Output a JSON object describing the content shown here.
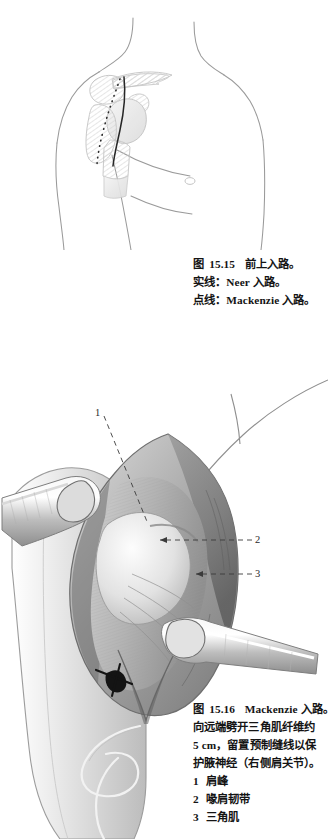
{
  "page": {
    "background": "#ffffff",
    "ink": "#141414",
    "artwork_tone": "#8d8d8d"
  },
  "figures": [
    {
      "id": "15.15",
      "name": "anteroposterior-shoulder-approach-illustration",
      "description": "Line drawing of male torso, right shoulder, showing skeletal outline of scapula, clavicle, acromion and proximal humerus with two marked skin incisions",
      "markings": [
        {
          "type": "solid-line",
          "meaning": "Neer approach incision"
        },
        {
          "type": "dotted-line",
          "meaning": "Mackenzie approach incision"
        }
      ]
    },
    {
      "id": "15.16",
      "name": "mackenzie-approach-surgical-exposure",
      "description": "Surgical field of right shoulder with deltoid split, two metal retractors and a stay suture at the distal apex of the split",
      "callouts": [
        {
          "number": "1",
          "x": 95,
          "y": 407
        },
        {
          "number": "2",
          "x": 255,
          "y": 534
        },
        {
          "number": "3",
          "x": 255,
          "y": 568
        }
      ]
    }
  ],
  "caption_1515": {
    "figure_word": "图",
    "number": "15.15",
    "title": "前上入路。",
    "lines": [
      "实线：Neer 入路。",
      "点线：Mackenzie 入路。"
    ]
  },
  "caption_1516": {
    "figure_word": "图",
    "number": "15.16",
    "title": "Mackenzie 入路。",
    "body": "向远端劈开三角肌纤维约 5 cm，留置预制缝线以保护腋神经（右侧肩关节）。",
    "body_lines": [
      "向远端劈开三角肌纤维约",
      "5 cm，留置预制缝线以保",
      "护腋神经（右侧肩关节）。"
    ],
    "legend": [
      {
        "index": "1",
        "label": "肩峰"
      },
      {
        "index": "2",
        "label": "喙肩韧带"
      },
      {
        "index": "3",
        "label": "三角肌"
      }
    ]
  }
}
